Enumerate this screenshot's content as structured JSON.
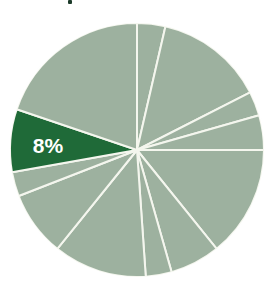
{
  "chart_data": {
    "type": "pie",
    "title": "",
    "start_angle_deg": 0,
    "direction": "clockwise",
    "slices": [
      {
        "label": "",
        "percent": 3.6,
        "color": "#9db19f"
      },
      {
        "label": "",
        "percent": 13.9,
        "color": "#9db19f"
      },
      {
        "label": "",
        "percent": 3.1,
        "color": "#9db19f"
      },
      {
        "label": "",
        "percent": 4.4,
        "color": "#9db19f"
      },
      {
        "label": "",
        "percent": 14.2,
        "color": "#9db19f"
      },
      {
        "label": "",
        "percent": 6.4,
        "color": "#9db19f"
      },
      {
        "label": "",
        "percent": 3.3,
        "color": "#9db19f"
      },
      {
        "label": "",
        "percent": 11.9,
        "color": "#9db19f"
      },
      {
        "label": "",
        "percent": 8.3,
        "color": "#9db19f"
      },
      {
        "label": "",
        "percent": 3.1,
        "color": "#9db19f"
      },
      {
        "label": "8%",
        "percent": 8,
        "color": "#1f6a38",
        "highlight": true
      },
      {
        "label": "",
        "percent": 19.8,
        "color": "#9db19f"
      }
    ],
    "highlight_label": "8%",
    "separator_color": "#f4f6ee",
    "legend": "none"
  },
  "style": {
    "base_color": "#9db19f",
    "highlight_color": "#1f6a38",
    "label_color": "#ffffff",
    "separator_color": "#f4f6ee"
  }
}
